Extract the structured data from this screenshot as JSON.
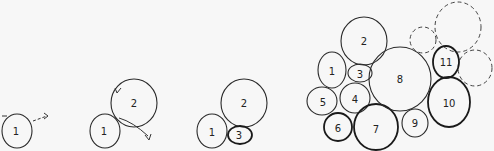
{
  "diagram": {
    "title": "",
    "panels": [
      {
        "id": "step-1",
        "circles": [
          {
            "label": "1",
            "cx": 17,
            "cy": 131,
            "r": 15
          }
        ],
        "arrow": "dashed arrow pointing right from circle 1"
      },
      {
        "id": "step-2",
        "circles": [
          {
            "label": "1",
            "cx": 105,
            "cy": 131,
            "r": 15
          },
          {
            "label": "2",
            "cx": 134,
            "cy": 103,
            "r": 22
          }
        ],
        "arrow": "arrow curving down-right from tangent point"
      },
      {
        "id": "step-3",
        "circles": [
          {
            "label": "1",
            "cx": 212,
            "cy": 131,
            "r": 15
          },
          {
            "label": "2",
            "cx": 244,
            "cy": 103,
            "r": 22
          },
          {
            "label": "3",
            "cx": 240,
            "cy": 135,
            "r": 11
          }
        ]
      },
      {
        "id": "step-final",
        "circles": [
          {
            "label": "1",
            "cx": 332,
            "cy": 70,
            "r": 14
          },
          {
            "label": "2",
            "cx": 364,
            "cy": 41,
            "r": 22
          },
          {
            "label": "3",
            "cx": 360,
            "cy": 73,
            "r": 11
          },
          {
            "label": "4",
            "cx": 355,
            "cy": 98,
            "r": 15
          },
          {
            "label": "5",
            "cx": 323,
            "cy": 101,
            "r": 15
          },
          {
            "label": "6",
            "cx": 338,
            "cy": 128,
            "r": 14
          },
          {
            "label": "7",
            "cx": 375,
            "cy": 128,
            "r": 22
          },
          {
            "label": "8",
            "cx": 400,
            "cy": 79,
            "r": 31
          },
          {
            "label": "9",
            "cx": 415,
            "cy": 123,
            "r": 13
          },
          {
            "label": "10",
            "cx": 448,
            "cy": 102,
            "r": 22
          },
          {
            "label": "11",
            "cx": 446,
            "cy": 62,
            "r": 14
          }
        ],
        "dashed_circles": [
          {
            "cx": 423,
            "cy": 40,
            "r": 13
          },
          {
            "cx": 458,
            "cy": 27,
            "r": 24
          },
          {
            "cx": 475,
            "cy": 68,
            "r": 17
          }
        ]
      }
    ]
  }
}
